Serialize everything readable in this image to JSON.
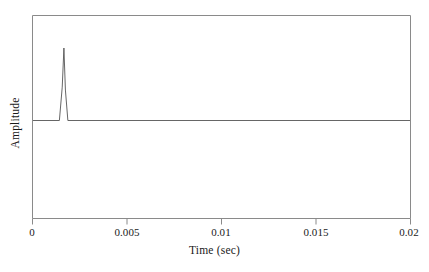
{
  "figure": {
    "background_color": "#ffffff",
    "line_color": "#808080",
    "signal_color": "#555555",
    "text_color": "#1a1a1a"
  },
  "axes": {
    "x_title": "Time (sec)",
    "y_title": "Amplitude",
    "x_tick_labels": [
      "0",
      "0.005",
      "0.01",
      "0.015",
      "0.02"
    ],
    "y_tick_labels": []
  },
  "chart_data": {
    "type": "line",
    "title": "",
    "subtitle": "",
    "xlabel": "Time (sec)",
    "ylabel": "Amplitude",
    "xlim": [
      0,
      0.02
    ],
    "ylim": [
      -0.52,
      1.05
    ],
    "xticks": [
      0,
      0.005,
      0.01,
      0.015,
      0.02
    ],
    "xtick_labels": [
      "0",
      "0.005",
      "0.01",
      "0.015",
      "0.02"
    ],
    "yticks": [],
    "ytick_labels": [],
    "grid": false,
    "legend": null,
    "annotations": [],
    "series": [
      {
        "name": "impulse response",
        "color": "#555555",
        "x": [
          0.0,
          0.0014,
          0.00155,
          0.00164,
          0.00172,
          0.00185,
          0.02
        ],
        "y": [
          0.0,
          0.0,
          0.46,
          1.0,
          0.42,
          0.0,
          0.0
        ]
      }
    ],
    "peak": {
      "x": 0.0016,
      "y": 1.0
    }
  }
}
